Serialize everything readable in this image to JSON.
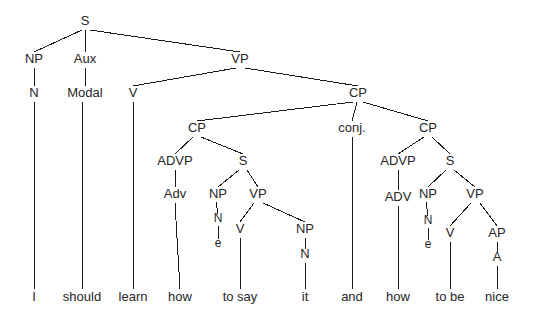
{
  "figure": {
    "name": "syntax-tree-diagram",
    "sentence": "I should learn how to say it and how to be nice",
    "width": 539,
    "height": 324,
    "background_color": "#ffffff",
    "line_color": "#1a1a1a",
    "text_color": "#262626"
  },
  "nodes": [
    {
      "id": "S",
      "label": "S",
      "x": 85,
      "y": 25,
      "size": "cat"
    },
    {
      "id": "NP1",
      "label": "NP",
      "x": 34,
      "y": 63,
      "size": "cat"
    },
    {
      "id": "AUX",
      "label": "Aux",
      "x": 85,
      "y": 63,
      "size": "cat"
    },
    {
      "id": "VP1",
      "label": "VP",
      "x": 240,
      "y": 63,
      "size": "cat"
    },
    {
      "id": "N1",
      "label": "N",
      "x": 34,
      "y": 97,
      "size": "cat"
    },
    {
      "id": "MODAL",
      "label": "Modal",
      "x": 85,
      "y": 97,
      "size": "cat"
    },
    {
      "id": "V1",
      "label": "V",
      "x": 133,
      "y": 97,
      "size": "cat"
    },
    {
      "id": "CPTOP",
      "label": "CP",
      "x": 358,
      "y": 97,
      "size": "cat"
    },
    {
      "id": "CPL",
      "label": "CP",
      "x": 197,
      "y": 132,
      "size": "cat"
    },
    {
      "id": "CONJ",
      "label": "conj.",
      "x": 352,
      "y": 132,
      "size": "cat"
    },
    {
      "id": "CPR",
      "label": "CP",
      "x": 428,
      "y": 132,
      "size": "cat"
    },
    {
      "id": "ADVPL",
      "label": "ADVP",
      "x": 175,
      "y": 165,
      "size": "cat"
    },
    {
      "id": "SL",
      "label": "S",
      "x": 243,
      "y": 165,
      "size": "cat"
    },
    {
      "id": "ADVPR",
      "label": "ADVP",
      "x": 398,
      "y": 165,
      "size": "cat"
    },
    {
      "id": "SR",
      "label": "S",
      "x": 450,
      "y": 165,
      "size": "cat"
    },
    {
      "id": "ADVL",
      "label": "Adv",
      "x": 175,
      "y": 198,
      "size": "cat"
    },
    {
      "id": "NPL",
      "label": "NP",
      "x": 218,
      "y": 198,
      "size": "cat"
    },
    {
      "id": "VPL",
      "label": "VP",
      "x": 258,
      "y": 198,
      "size": "cat"
    },
    {
      "id": "ADVR",
      "label": "ADV",
      "x": 398,
      "y": 201,
      "size": "cat"
    },
    {
      "id": "NPR",
      "label": "NP",
      "x": 428,
      "y": 198,
      "size": "cat"
    },
    {
      "id": "VPR",
      "label": "VP",
      "x": 475,
      "y": 198,
      "size": "cat"
    },
    {
      "id": "NL",
      "label": "N",
      "x": 218,
      "y": 222,
      "size": "small"
    },
    {
      "id": "EL",
      "label": "e",
      "x": 218,
      "y": 247,
      "size": "small"
    },
    {
      "id": "V2",
      "label": "V",
      "x": 240,
      "y": 233,
      "size": "cat"
    },
    {
      "id": "NPIT",
      "label": "NP",
      "x": 305,
      "y": 233,
      "size": "cat"
    },
    {
      "id": "NIT",
      "label": "N",
      "x": 305,
      "y": 258,
      "size": "cat"
    },
    {
      "id": "NR",
      "label": "N",
      "x": 428,
      "y": 224,
      "size": "small"
    },
    {
      "id": "ER",
      "label": "e",
      "x": 428,
      "y": 248,
      "size": "small"
    },
    {
      "id": "V3",
      "label": "V",
      "x": 450,
      "y": 237,
      "size": "cat"
    },
    {
      "id": "AP",
      "label": "AP",
      "x": 497,
      "y": 237,
      "size": "cat"
    },
    {
      "id": "A",
      "label": "A",
      "x": 497,
      "y": 261,
      "size": "cat"
    }
  ],
  "leaves": [
    {
      "id": "W1",
      "label": "I",
      "x": 34,
      "y": 301,
      "from_x": 34,
      "from_y": 102,
      "line_top": 265
    },
    {
      "id": "W2",
      "label": "should",
      "x": 82,
      "y": 301,
      "from_x": 82,
      "from_y": 102,
      "line_top": 265
    },
    {
      "id": "W3",
      "label": "learn",
      "x": 133,
      "y": 301,
      "from_x": 133,
      "from_y": 102,
      "line_top": 265
    },
    {
      "id": "W4",
      "label": "how",
      "x": 180,
      "y": 301,
      "from_x": 175,
      "from_y": 203,
      "line_top": 265
    },
    {
      "id": "W5",
      "label": "to say",
      "x": 240,
      "y": 301,
      "from_x": 240,
      "from_y": 238,
      "line_top": 265
    },
    {
      "id": "W6",
      "label": "it",
      "x": 305,
      "y": 301,
      "from_x": 305,
      "from_y": 263,
      "line_top": 265
    },
    {
      "id": "W7",
      "label": "and",
      "x": 352,
      "y": 301,
      "from_x": 352,
      "from_y": 137,
      "line_top": 265
    },
    {
      "id": "W8",
      "label": "how",
      "x": 398,
      "y": 301,
      "from_x": 398,
      "from_y": 206,
      "line_top": 265
    },
    {
      "id": "W9",
      "label": "to be",
      "x": 450,
      "y": 301,
      "from_x": 450,
      "from_y": 242,
      "line_top": 265
    },
    {
      "id": "W10",
      "label": "nice",
      "x": 497,
      "y": 301,
      "from_x": 497,
      "from_y": 266,
      "line_top": 265
    }
  ],
  "edges": [
    {
      "from": "S",
      "to": "NP1",
      "x1": 82,
      "y1": 30,
      "x2": 34,
      "y2": 52
    },
    {
      "from": "S",
      "to": "AUX",
      "x1": 85,
      "y1": 30,
      "x2": 85,
      "y2": 52
    },
    {
      "from": "S",
      "to": "VP1",
      "x1": 90,
      "y1": 30,
      "x2": 240,
      "y2": 52
    },
    {
      "from": "NP1",
      "to": "N1",
      "x1": 34,
      "y1": 68,
      "x2": 34,
      "y2": 86
    },
    {
      "from": "AUX",
      "to": "MODAL",
      "x1": 85,
      "y1": 68,
      "x2": 85,
      "y2": 86
    },
    {
      "from": "VP1",
      "to": "V1",
      "x1": 236,
      "y1": 68,
      "x2": 133,
      "y2": 86
    },
    {
      "from": "VP1",
      "to": "CPTOP",
      "x1": 245,
      "y1": 68,
      "x2": 358,
      "y2": 86
    },
    {
      "from": "CPTOP",
      "to": "CPL",
      "x1": 353,
      "y1": 102,
      "x2": 197,
      "y2": 121
    },
    {
      "from": "CPTOP",
      "to": "CONJ",
      "x1": 357,
      "y1": 102,
      "x2": 352,
      "y2": 121
    },
    {
      "from": "CPTOP",
      "to": "CPR",
      "x1": 363,
      "y1": 102,
      "x2": 428,
      "y2": 121
    },
    {
      "from": "CPL",
      "to": "ADVPL",
      "x1": 193,
      "y1": 137,
      "x2": 175,
      "y2": 154
    },
    {
      "from": "CPL",
      "to": "SL",
      "x1": 201,
      "y1": 137,
      "x2": 243,
      "y2": 154
    },
    {
      "from": "CPR",
      "to": "ADVPR",
      "x1": 424,
      "y1": 137,
      "x2": 398,
      "y2": 154
    },
    {
      "from": "CPR",
      "to": "SR",
      "x1": 432,
      "y1": 137,
      "x2": 450,
      "y2": 154
    },
    {
      "from": "ADVPL",
      "to": "ADVL",
      "x1": 175,
      "y1": 170,
      "x2": 175,
      "y2": 187
    },
    {
      "from": "SL",
      "to": "NPL",
      "x1": 239,
      "y1": 170,
      "x2": 218,
      "y2": 187
    },
    {
      "from": "SL",
      "to": "VPL",
      "x1": 247,
      "y1": 170,
      "x2": 258,
      "y2": 187
    },
    {
      "from": "ADVPR",
      "to": "ADVR",
      "x1": 398,
      "y1": 170,
      "x2": 398,
      "y2": 190
    },
    {
      "from": "SR",
      "to": "NPR",
      "x1": 446,
      "y1": 170,
      "x2": 428,
      "y2": 187
    },
    {
      "from": "SR",
      "to": "VPR",
      "x1": 454,
      "y1": 170,
      "x2": 475,
      "y2": 187
    },
    {
      "from": "NPL",
      "to": "NL",
      "x1": 216,
      "y1": 202,
      "x2": 218,
      "y2": 214
    },
    {
      "from": "NL",
      "to": "EL",
      "x1": 218,
      "y1": 226,
      "x2": 218,
      "y2": 239
    },
    {
      "from": "VPL",
      "to": "V2",
      "x1": 254,
      "y1": 203,
      "x2": 240,
      "y2": 222
    },
    {
      "from": "VPL",
      "to": "NPIT",
      "x1": 263,
      "y1": 203,
      "x2": 305,
      "y2": 222
    },
    {
      "from": "NPIT",
      "to": "NIT",
      "x1": 305,
      "y1": 238,
      "x2": 305,
      "y2": 249
    },
    {
      "from": "NPR",
      "to": "NR",
      "x1": 426,
      "y1": 202,
      "x2": 428,
      "y2": 216
    },
    {
      "from": "NR",
      "to": "ER",
      "x1": 428,
      "y1": 228,
      "x2": 428,
      "y2": 240
    },
    {
      "from": "VPR",
      "to": "V3",
      "x1": 471,
      "y1": 203,
      "x2": 450,
      "y2": 226
    },
    {
      "from": "VPR",
      "to": "AP",
      "x1": 480,
      "y1": 203,
      "x2": 497,
      "y2": 226
    },
    {
      "from": "AP",
      "to": "A",
      "x1": 497,
      "y1": 242,
      "x2": 497,
      "y2": 252
    }
  ]
}
